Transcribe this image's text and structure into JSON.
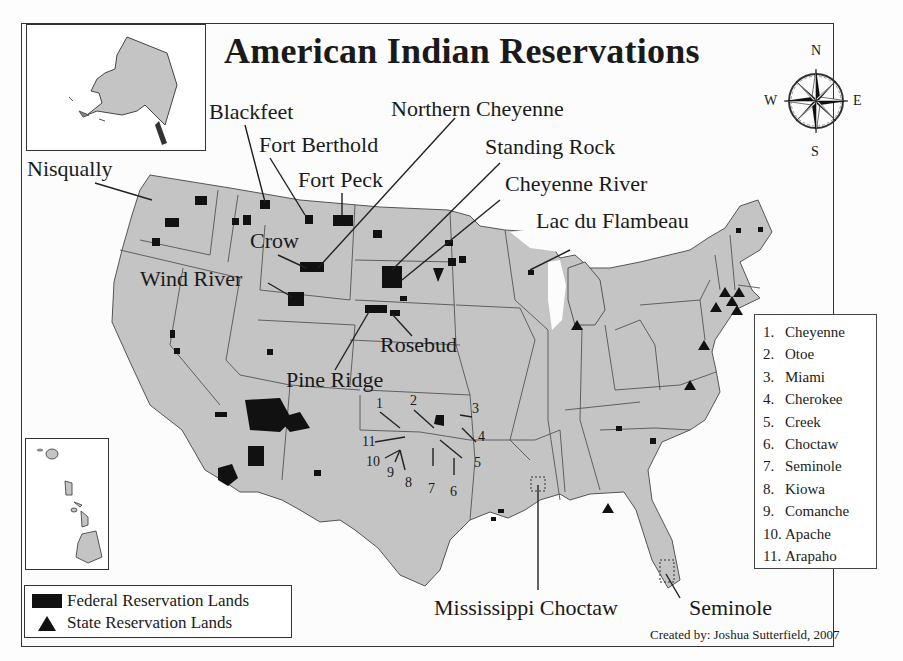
{
  "map": {
    "title": "American Indian Reservations",
    "credit": "Created by: Joshua Sutterfield, 2007",
    "colors": {
      "land": "#c4c4c4",
      "border": "#555555",
      "reservation": "#111111",
      "background": "#fcfcfc"
    },
    "compass": {
      "n": "N",
      "s": "S",
      "e": "E",
      "w": "W"
    },
    "insets": [
      {
        "name": "Alaska"
      },
      {
        "name": "Hawaii"
      }
    ],
    "labels": {
      "nisqually": "Nisqually",
      "blackfeet": "Blackfeet",
      "fort_berthold": "Fort Berthold",
      "fort_peck": "Fort Peck",
      "northern_cheyenne": "Northern Cheyenne",
      "standing_rock": "Standing Rock",
      "cheyenne_river": "Cheyenne River",
      "lac_du_flambeau": "Lac du Flambeau",
      "crow": "Crow",
      "wind_river": "Wind River",
      "rosebud": "Rosebud",
      "pine_ridge": "Pine Ridge",
      "mississippi_choctaw": "Mississippi Choctaw",
      "seminole": "Seminole"
    },
    "oklahoma_numbers": [
      "1",
      "2",
      "3",
      "4",
      "5",
      "6",
      "7",
      "8",
      "9",
      "10",
      "11"
    ],
    "tribe_list": [
      {
        "n": "1.",
        "name": "Cheyenne"
      },
      {
        "n": "2.",
        "name": "Otoe"
      },
      {
        "n": "3.",
        "name": "Miami"
      },
      {
        "n": "4.",
        "name": "Cherokee"
      },
      {
        "n": "5.",
        "name": "Creek"
      },
      {
        "n": "6.",
        "name": "Choctaw"
      },
      {
        "n": "7.",
        "name": "Seminole"
      },
      {
        "n": "8.",
        "name": "Kiowa"
      },
      {
        "n": "9.",
        "name": "Comanche"
      },
      {
        "n": "10.",
        "name": "Apache"
      },
      {
        "n": "11.",
        "name": "Arapaho"
      }
    ],
    "legend": {
      "federal": "Federal Reservation Lands",
      "state": "State Reservation Lands"
    }
  }
}
